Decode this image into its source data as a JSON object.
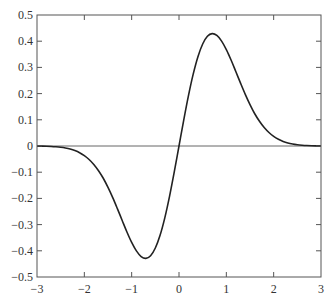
{
  "chart_data": {
    "type": "line",
    "title": "",
    "xlabel": "",
    "ylabel": "",
    "xlim": [
      -3,
      3
    ],
    "ylim": [
      -0.5,
      0.5
    ],
    "grid": false,
    "legend": null,
    "x_ticks": [
      "−3",
      "−2",
      "−1",
      "0",
      "1",
      "2",
      "3"
    ],
    "y_ticks": [
      "−0.5",
      "−0.4",
      "−0.3",
      "−0.2",
      "−0.1",
      "0",
      "0.1",
      "0.2",
      "0.3",
      "0.4",
      "0.5"
    ],
    "reference_lines": [
      {
        "orientation": "horizontal",
        "y": 0
      }
    ],
    "series": [
      {
        "name": "y = x·exp(−x²)",
        "color": "#222222",
        "x": [
          -3.0,
          -2.9,
          -2.8,
          -2.7,
          -2.6,
          -2.5,
          -2.4,
          -2.3,
          -2.2,
          -2.1,
          -2.0,
          -1.9,
          -1.8,
          -1.7,
          -1.6,
          -1.5,
          -1.4,
          -1.3,
          -1.2,
          -1.1,
          -1.0,
          -0.9,
          -0.8,
          -0.7,
          -0.6,
          -0.5,
          -0.4,
          -0.3,
          -0.2,
          -0.1,
          0.0,
          0.1,
          0.2,
          0.3,
          0.4,
          0.5,
          0.6,
          0.7,
          0.8,
          0.9,
          1.0,
          1.1,
          1.2,
          1.3,
          1.4,
          1.5,
          1.6,
          1.7,
          1.8,
          1.9,
          2.0,
          2.1,
          2.2,
          2.3,
          2.4,
          2.5,
          2.6,
          2.7,
          2.8,
          2.9,
          3.0
        ],
        "values": [
          -0.0004,
          -0.0006,
          -0.0011,
          -0.0018,
          -0.003,
          -0.0048,
          -0.0076,
          -0.0116,
          -0.0174,
          -0.0255,
          -0.0366,
          -0.0514,
          -0.0704,
          -0.0943,
          -0.1231,
          -0.1581,
          -0.197,
          -0.2398,
          -0.2843,
          -0.3281,
          -0.3679,
          -0.4003,
          -0.4218,
          -0.4288,
          -0.4186,
          -0.3894,
          -0.3409,
          -0.2742,
          -0.1922,
          -0.099,
          0.0,
          0.099,
          0.1922,
          0.2742,
          0.3409,
          0.3894,
          0.4186,
          0.4288,
          0.4218,
          0.4003,
          0.3679,
          0.3281,
          0.2843,
          0.2398,
          0.197,
          0.1581,
          0.1231,
          0.0943,
          0.0704,
          0.0514,
          0.0366,
          0.0255,
          0.0174,
          0.0116,
          0.0076,
          0.0048,
          0.003,
          0.0018,
          0.0011,
          0.0006,
          0.0004
        ]
      }
    ]
  }
}
